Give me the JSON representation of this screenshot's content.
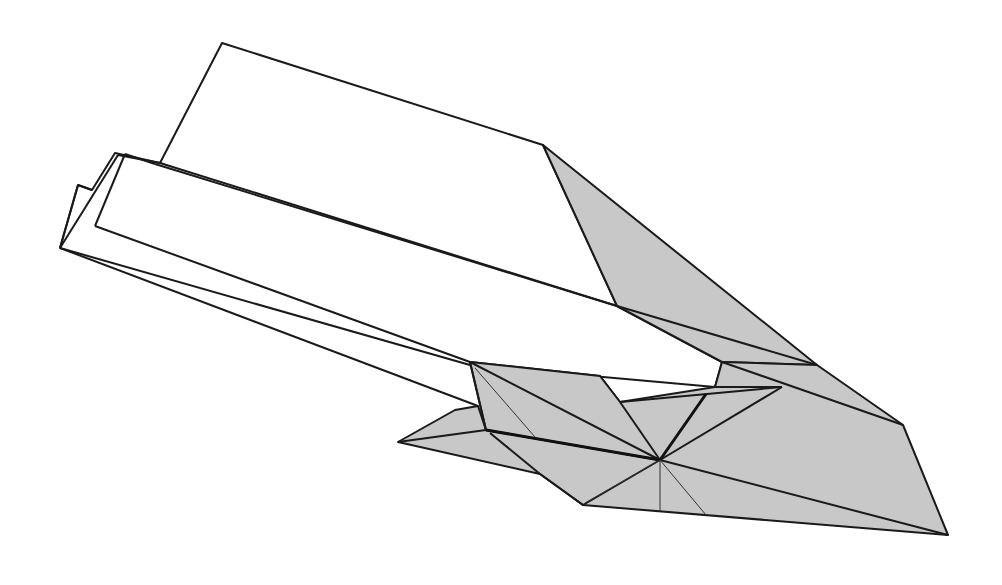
{
  "diagram": {
    "colors": {
      "background": "#ffffff",
      "shaded_face": "#c8c8c8",
      "line": "#1a1a1a"
    },
    "text_labels": []
  }
}
